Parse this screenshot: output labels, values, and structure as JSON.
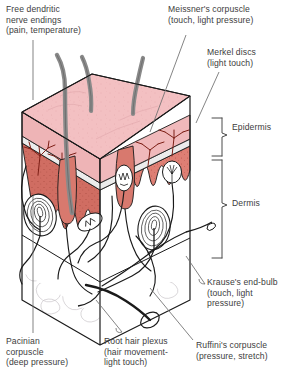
{
  "diagram": {
    "type": "anatomical-cross-section",
    "labels": {
      "free_nerve_endings": "Free dendritic\nnerve endings\n(pain, temperature)",
      "meissner": "Meissner's corpuscle\n(touch, light pressure)",
      "merkel": "Merkel discs\n(light touch)",
      "epidermis": "Epidermis",
      "dermis": "Dermis",
      "krause": "Krause's end-bulb\n(touch, light\npressure)",
      "ruffini": "Ruffini's corpuscle\n(pressure, stretch)",
      "pacinian": "Pacinian\ncorpuscle\n(deep pressure)",
      "root_hair_plexus": "Root hair plexus\n(hair movement-\nlight touch)"
    },
    "colors": {
      "background": "#ffffff",
      "epidermis_top": "#f3c0c2",
      "epidermis_side": "#eeb4b6",
      "papillary_dermis": "#de7f74",
      "papillary_dermis_dark": "#d06d62",
      "stratum_band": "#e8e8e8",
      "hair_shaft": "#8a8a8a",
      "hair_shaft_dark": "#6f6f6f",
      "capillary": "#7d1f16",
      "outline": "#1a1a1a",
      "leader_line": "#6e6e6e",
      "hypodermis_mesh": "#c9c4c8",
      "text": "#3d3d3d"
    },
    "structures": [
      {
        "name": "hair-shaft",
        "count": 3
      },
      {
        "name": "hair-follicle",
        "count": 2
      },
      {
        "name": "pacinian-corpuscle",
        "count": 3
      },
      {
        "name": "meissner-corpuscle",
        "count": 2
      },
      {
        "name": "krause-end-bulb",
        "count": 1
      },
      {
        "name": "ruffini-corpuscle",
        "count": 1
      },
      {
        "name": "capillary-loop",
        "count": 2
      },
      {
        "name": "dermal-papilla-row",
        "count": 1
      }
    ]
  }
}
